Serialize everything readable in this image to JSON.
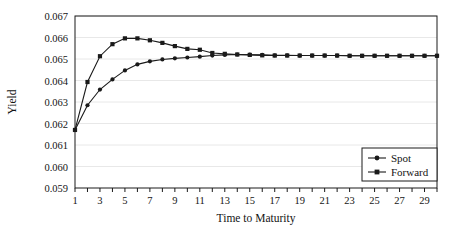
{
  "chart_data": {
    "type": "line",
    "title": "",
    "subtitle": "",
    "xlabel": "Time to Maturity",
    "ylabel": "Yield",
    "xlim": [
      1,
      30
    ],
    "ylim": [
      0.059,
      0.067
    ],
    "ytick_labels": [
      "0.059",
      "0.060",
      "0.061",
      "0.062",
      "0.063",
      "0.064",
      "0.065",
      "0.066",
      "0.067"
    ],
    "ytick_values": [
      0.059,
      0.06,
      0.061,
      0.062,
      0.063,
      0.064,
      0.065,
      0.066,
      0.067
    ],
    "xtick_labels": [
      "1",
      "3",
      "5",
      "7",
      "9",
      "11",
      "13",
      "15",
      "17",
      "19",
      "21",
      "23",
      "25",
      "27",
      "29"
    ],
    "xtick_values": [
      1,
      3,
      5,
      7,
      9,
      11,
      13,
      15,
      17,
      19,
      21,
      23,
      25,
      27,
      29
    ],
    "x_minor_ticks": [
      1,
      2,
      3,
      4,
      5,
      6,
      7,
      8,
      9,
      10,
      11,
      12,
      13,
      14,
      15,
      16,
      17,
      18,
      19,
      20,
      21,
      22,
      23,
      24,
      25,
      26,
      27,
      28,
      29,
      30
    ],
    "grid": "horizontal",
    "legend_position": "bottom-right",
    "x": [
      1,
      2,
      3,
      4,
      5,
      6,
      7,
      8,
      9,
      10,
      11,
      12,
      13,
      14,
      15,
      16,
      17,
      18,
      19,
      20,
      21,
      22,
      23,
      24,
      25,
      26,
      27,
      28,
      29,
      30
    ],
    "series": [
      {
        "name": "Spot",
        "marker": "circle",
        "color": "#1a1a1a",
        "values": [
          0.0617,
          0.06285,
          0.06358,
          0.06405,
          0.06447,
          0.06475,
          0.06489,
          0.06498,
          0.06503,
          0.06507,
          0.06511,
          0.06516,
          0.06519,
          0.06521,
          0.0652,
          0.06519,
          0.06517,
          0.06517,
          0.06516,
          0.06516,
          0.06516,
          0.06516,
          0.06515,
          0.06515,
          0.06515,
          0.06515,
          0.06515,
          0.06515,
          0.06515,
          0.06515
        ]
      },
      {
        "name": "Forward",
        "marker": "square",
        "color": "#1a1a1a",
        "values": [
          0.0617,
          0.06393,
          0.06513,
          0.06569,
          0.06596,
          0.06596,
          0.06587,
          0.06575,
          0.0656,
          0.06547,
          0.06543,
          0.06528,
          0.06524,
          0.06521,
          0.06519,
          0.06517,
          0.06516,
          0.06516,
          0.06516,
          0.06516,
          0.06516,
          0.06516,
          0.06515,
          0.06515,
          0.06515,
          0.06515,
          0.06515,
          0.06515,
          0.06515,
          0.06515
        ]
      }
    ],
    "legend": [
      "Spot",
      "Forward"
    ]
  },
  "colors": {
    "axis": "#1a1a1a",
    "grid": "#e8e8e8",
    "plot_background": "#ffffff",
    "series": "#1a1a1a"
  }
}
